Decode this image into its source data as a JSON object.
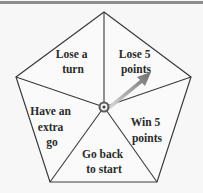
{
  "spinner": {
    "shape": "pentagon",
    "sections": [
      {
        "id": "lose-a-turn",
        "lines": [
          "Lose a",
          "turn"
        ]
      },
      {
        "id": "lose-5-points",
        "lines": [
          "Lose 5",
          "points"
        ]
      },
      {
        "id": "win-5-points",
        "lines": [
          "Win 5",
          "points"
        ]
      },
      {
        "id": "go-back-to-start",
        "lines": [
          "Go back",
          "to start"
        ]
      },
      {
        "id": "have-an-extra-go",
        "lines": [
          "Have an",
          "extra",
          "go"
        ]
      }
    ],
    "pointer": {
      "points_to": "Lose 5 points"
    },
    "colors": {
      "background": "#f7f7f7",
      "lines": "#3a3a3a",
      "text": "#2a2a2a",
      "top_bar": "#8e8e8e"
    }
  }
}
